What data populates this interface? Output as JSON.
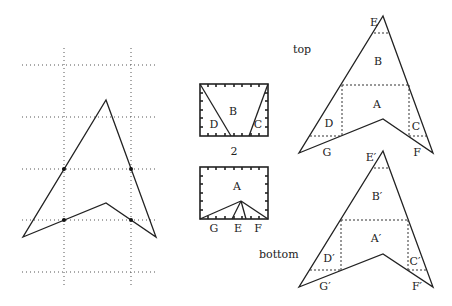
{
  "figure": {
    "left_grid": {
      "horizontal_lines_y": [
        65,
        117,
        169,
        220,
        272
      ],
      "vertical_lines_x": [
        64,
        131
      ],
      "x_range": [
        22,
        158
      ],
      "y_range": [
        48,
        285
      ],
      "polygon": [
        [
          106,
          100
        ],
        [
          156,
          237
        ],
        [
          106,
          203
        ],
        [
          23,
          237
        ]
      ],
      "marked_points": [
        [
          64,
          169
        ],
        [
          131,
          169
        ],
        [
          64,
          220
        ],
        [
          131,
          220
        ]
      ]
    },
    "middle": {
      "top_rect": {
        "labels": {
          "B": "B",
          "D": "D",
          "C": "C"
        }
      },
      "caption": "2",
      "bottom_rect": {
        "labels": {
          "A": "A",
          "G": "G",
          "E": "E",
          "F": "F"
        }
      }
    },
    "right_top": {
      "title": "top",
      "labels": {
        "E": "E",
        "B": "B",
        "A": "A",
        "D": "D",
        "C": "C",
        "G": "G",
        "F": "F"
      }
    },
    "right_bottom": {
      "title": "bottom",
      "labels": {
        "E": "E′",
        "B": "B′",
        "A": "A′",
        "D": "D′",
        "C": "C′",
        "G": "G′",
        "F": "F′"
      }
    }
  }
}
